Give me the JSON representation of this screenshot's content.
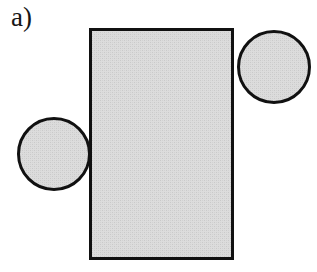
{
  "figure": {
    "panel_label": "a)",
    "caption_text": "",
    "background_color": "#ffffff"
  },
  "style": {
    "stroke_color": "#111111",
    "fill_color": "#d9d9d9",
    "fill_texture": "halftone-dither",
    "rect_stroke_width": 3,
    "circle_stroke_width": 3
  },
  "shapes": {
    "rectangle": {
      "name": "central-rectangle",
      "x": 89,
      "y": 28,
      "width": 145,
      "height": 232,
      "fill": "#d9d9d9",
      "stroke": "#111111",
      "stroke_width": 3
    },
    "circles": [
      {
        "name": "left-circle",
        "cx": 54,
        "cy": 154,
        "r": 37,
        "fill": "#d9d9d9",
        "stroke": "#111111",
        "stroke_width": 3
      },
      {
        "name": "right-circle",
        "cx": 274,
        "cy": 67,
        "r": 37,
        "fill": "#d9d9d9",
        "stroke": "#111111",
        "stroke_width": 3
      }
    ]
  }
}
